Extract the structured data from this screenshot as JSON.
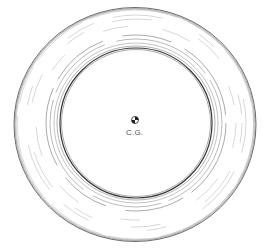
{
  "figure": {
    "center_marker": {
      "label": "C.G.",
      "icon": "center-of-gravity-icon"
    },
    "colors": {
      "line": "#333333",
      "light_line": "#888888",
      "background": "#ffffff"
    }
  }
}
